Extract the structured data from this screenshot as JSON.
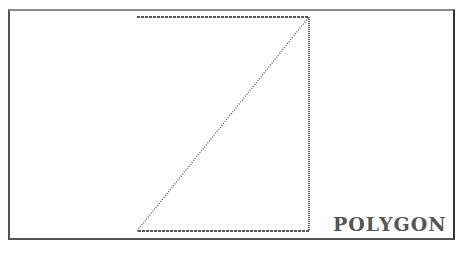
{
  "screen": {
    "label": "POLYGON",
    "colors": {
      "stroke": "#666666",
      "frame": "#555555",
      "background": "#ffffff"
    },
    "polygon": {
      "top_line": {
        "x1": 137,
        "y1": 17,
        "x2": 309,
        "y2": 17
      },
      "right_line": {
        "x1": 309,
        "y1": 17,
        "x2": 309,
        "y2": 231
      },
      "bottom_line": {
        "x1": 309,
        "y1": 231,
        "x2": 137,
        "y2": 231
      },
      "diagonal": {
        "x1": 137,
        "y1": 231,
        "x2": 309,
        "y2": 17
      }
    }
  }
}
